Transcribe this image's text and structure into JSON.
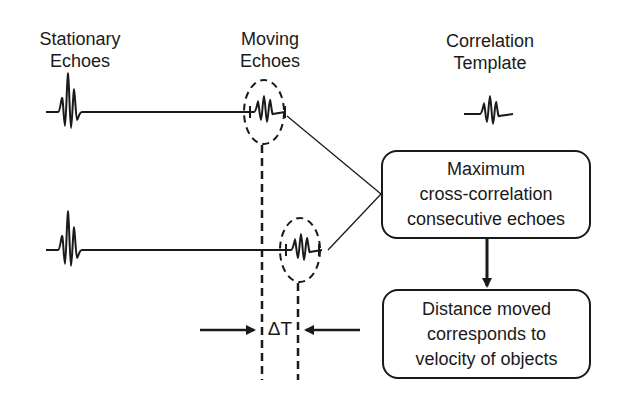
{
  "labels": {
    "stationary": [
      "Stationary",
      "Echoes"
    ],
    "moving": [
      "Moving",
      "Echoes"
    ],
    "template": [
      "Correlation",
      "Template"
    ]
  },
  "boxes": {
    "correlation": [
      "Maximum",
      "cross-correlation",
      "consecutive echoes"
    ],
    "velocity": [
      "Distance moved",
      "corresponds to",
      "velocity of objects"
    ]
  },
  "delta_label": "ΔT",
  "colors": {
    "stroke": "#1a1a1a",
    "background": "#ffffff"
  }
}
